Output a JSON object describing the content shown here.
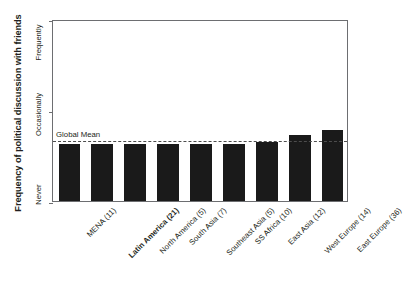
{
  "chart_data": {
    "type": "bar",
    "title": "",
    "xlabel": "",
    "ylabel": "Frequency of political discussion with friends",
    "categories": [
      "MENA (11)",
      "Latin America (21)",
      "North America (5)",
      "South Asia (7)",
      "Southeast Asia (5)",
      "SS Africa (10)",
      "East Asia (12)",
      "West Europe (14)",
      "East Europe (36)"
    ],
    "values": [
      0.63,
      0.63,
      0.63,
      0.63,
      0.63,
      0.63,
      0.65,
      0.72,
      0.78
    ],
    "highlight_category": "Latin America (21)",
    "ylim": [
      0,
      2
    ],
    "ytick_values": [
      0,
      1,
      2
    ],
    "ytick_labels": [
      "Never",
      "Occasionally",
      "Frequently"
    ],
    "grid": false,
    "legend": "none",
    "annotations": [
      {
        "name": "global-mean",
        "label": "Global Mean",
        "value": 0.68,
        "style": "dashed"
      }
    ],
    "bar_color": "#1a1a1a",
    "frame_color": "#6d6e71"
  },
  "axis": {
    "y_title": "Frequency of political discussion with friends",
    "y_ticks": {
      "top": "Frequently",
      "middle": "Occasionally",
      "bottom": "Never"
    }
  },
  "mean": {
    "label": "Global Mean"
  }
}
